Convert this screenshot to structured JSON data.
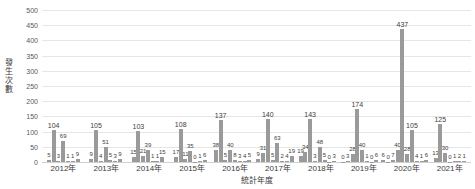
{
  "chart_data": {
    "type": "bar",
    "title": "",
    "subtitle": "",
    "xlabel": "統計年度",
    "ylabel": "發生次數",
    "ylim": [
      0,
      500
    ],
    "ytick_step": 50,
    "yticks": [
      "0",
      "50",
      "100",
      "150",
      "200",
      "250",
      "300",
      "350",
      "400",
      "450",
      "500"
    ],
    "grid": true,
    "legend": "none",
    "bar_color": "#9a9a9a",
    "categories": [
      "2012年",
      "2013年",
      "2014年",
      "2015年",
      "2016年",
      "2017年",
      "2018年",
      "2019年",
      "2020年",
      "2021年"
    ],
    "groups": [
      {
        "category": "2012年",
        "values": [
          5,
          104,
          3,
          69,
          1,
          1,
          9
        ]
      },
      {
        "category": "2013年",
        "values": [
          9,
          105,
          4,
          51,
          5,
          3,
          9
        ]
      },
      {
        "category": "2014年",
        "values": [
          15,
          103,
          21,
          39,
          1,
          1,
          15
        ]
      },
      {
        "category": "2015年",
        "values": [
          17,
          108,
          11,
          35,
          0,
          1,
          6
        ]
      },
      {
        "category": "2016年",
        "values": [
          38,
          137,
          5,
          40,
          8,
          3,
          4,
          5
        ]
      },
      {
        "category": "2017年",
        "values": [
          9,
          31,
          140,
          5,
          63,
          2,
          4,
          19
        ]
      },
      {
        "category": "2018年",
        "values": [
          19,
          34,
          143,
          3,
          48,
          5,
          0,
          3
        ]
      },
      {
        "category": "2019年",
        "values": [
          0,
          3,
          28,
          174,
          40,
          1,
          0,
          6
        ]
      },
      {
        "category": "2020年",
        "values": [
          6,
          0,
          7,
          40,
          437,
          28,
          105,
          4,
          1,
          6
        ]
      },
      {
        "category": "2021年",
        "values": [
          13,
          125,
          30,
          0,
          1,
          2,
          1
        ]
      }
    ]
  }
}
